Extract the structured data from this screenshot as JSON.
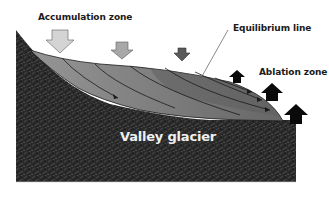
{
  "diagram": {
    "title": "Valley glacier",
    "labels": {
      "accumulation_zone": "Accumulation zone",
      "equilibrium_line": "Equilibrium line",
      "ablation_zone": "Ablation zone",
      "valley_glacier": "Valley glacier"
    },
    "arrows": {
      "accumulation": [
        {
          "direction": "down",
          "size": "large",
          "color": "#d4d4d4"
        },
        {
          "direction": "down",
          "size": "medium",
          "color": "#a8a8a8"
        },
        {
          "direction": "down",
          "size": "small",
          "color": "#5a5a5a"
        }
      ],
      "ablation": [
        {
          "direction": "up",
          "size": "small",
          "color": "#0a0a0a"
        },
        {
          "direction": "up",
          "size": "medium",
          "color": "#0a0a0a"
        },
        {
          "direction": "up",
          "size": "large",
          "color": "#0a0a0a"
        }
      ]
    },
    "colors": {
      "rock": "#2a2a2a",
      "ice_light": "#8c8c8c",
      "ice_dark": "#6a6a6a",
      "flow_line": "#1a1a1a",
      "background": "#ffffff"
    }
  }
}
